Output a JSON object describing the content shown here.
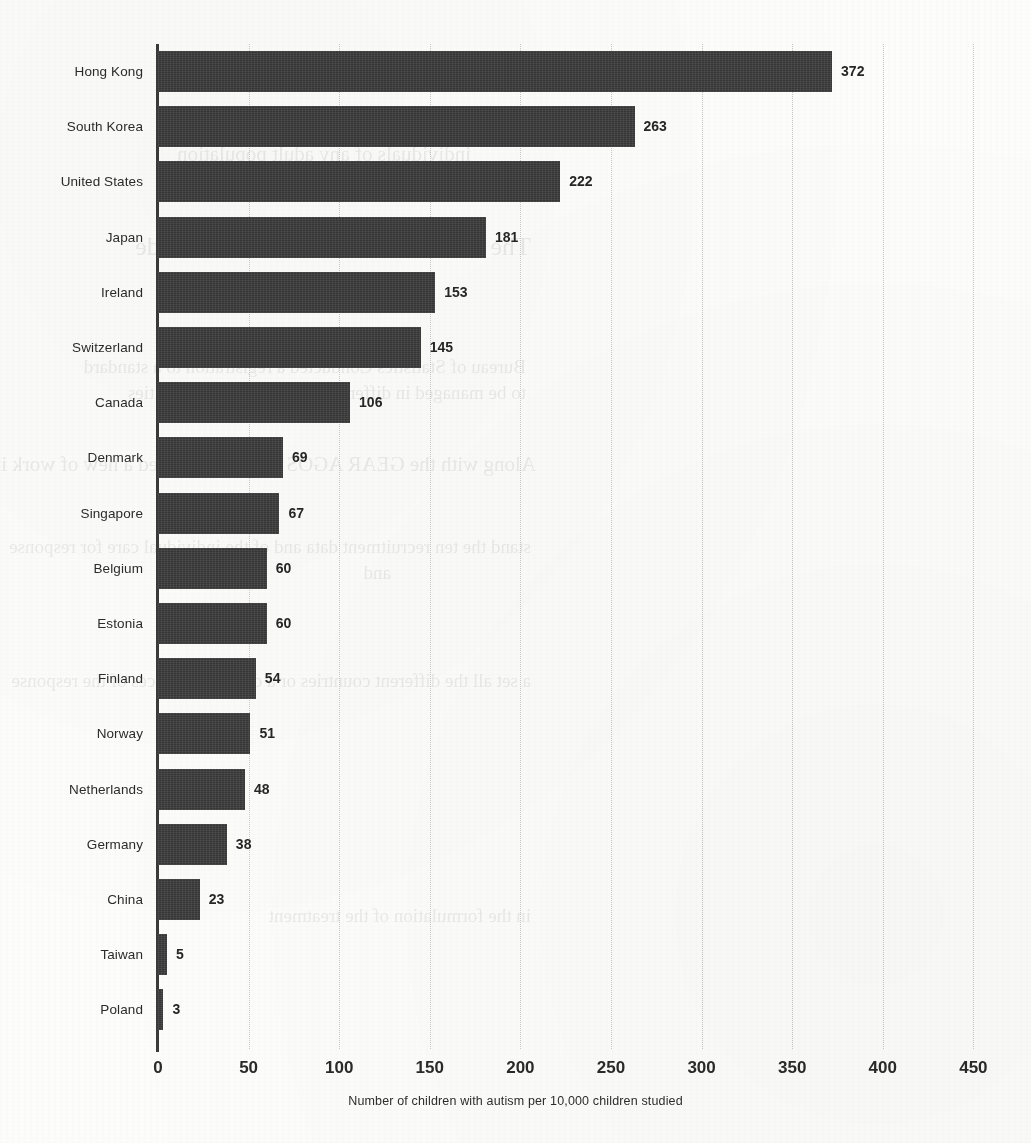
{
  "chart_data": {
    "type": "bar",
    "orientation": "horizontal",
    "title": "",
    "xlabel": "Number of children with autism per 10,000 children studied",
    "ylabel": "",
    "xlim": [
      0,
      450
    ],
    "xticks": [
      0,
      50,
      100,
      150,
      200,
      250,
      300,
      350,
      400,
      450
    ],
    "grid": true,
    "legend": "none",
    "bar_color": "#3c3c3c",
    "categories": [
      "Hong Kong",
      "South Korea",
      "United States",
      "Japan",
      "Ireland",
      "Switzerland",
      "Canada",
      "Denmark",
      "Singapore",
      "Belgium",
      "Estonia",
      "Finland",
      "Norway",
      "Netherlands",
      "Germany",
      "China",
      "Taiwan",
      "Poland"
    ],
    "values": [
      372,
      263,
      222,
      181,
      153,
      145,
      106,
      69,
      67,
      60,
      60,
      54,
      51,
      48,
      38,
      23,
      5,
      3
    ],
    "value_labels": [
      "372",
      "263",
      "222",
      "181",
      "153",
      "145",
      "106",
      "69",
      "67",
      "60",
      "60",
      "54",
      "51",
      "48",
      "38",
      "23",
      "5",
      "3"
    ]
  },
  "axis": {
    "tick_labels": [
      "0",
      "50",
      "100",
      "150",
      "200",
      "250",
      "300",
      "350",
      "400",
      "450"
    ],
    "caption": "Number of children with autism per 10,000 children studied"
  },
  "background_bleed": {
    "lines": [
      "people of different ages, and to assess",
      "individuals of any adult population",
      "The GEAR AGOS Still in Child Code",
      "Bureau of Statistics Conducted a registration to a standard",
      "to be managed in different countries or communities",
      "Along with the GEAR AGOS to 10 Obras need a new of work in the",
      "stand the ten recruitment data and of the individual care for response",
      "and",
      "a set all the different countries or a different services of the response",
      "in the formulation of the treatment"
    ]
  }
}
